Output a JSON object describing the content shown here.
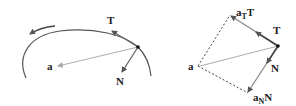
{
  "left_figure": {
    "labels": {
      "tangent": "T",
      "normal": "N",
      "acceleration": "a"
    }
  },
  "right_figure": {
    "labels": {
      "tangent": "T",
      "normal": "N",
      "acceleration": "a",
      "tangential_component_base": "a",
      "tangential_component_sub": "T",
      "tangential_component_vec": "T",
      "normal_component_base": "a",
      "normal_component_sub": "N",
      "normal_component_vec": "N"
    }
  },
  "colors": {
    "curve": "#555555",
    "vector_dark": "#666666",
    "vector_light": "#b0b0b0",
    "dashed": "#444444",
    "point": "#111111"
  }
}
